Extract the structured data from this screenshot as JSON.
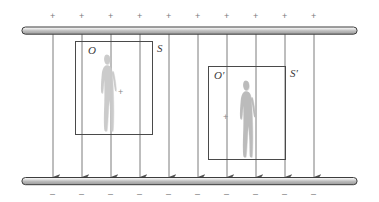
{
  "figure": {
    "background_color": "#ffffff",
    "width": 379,
    "height": 202
  },
  "plates": {
    "top": {
      "name": "positive-plate",
      "charge_symbol": "+",
      "charge_count": 10,
      "color_light": "#f2f2f2",
      "color_dark": "#9a9a9a",
      "outline_color": "#3d3d3d",
      "x1": 22,
      "x2": 357,
      "y": 27,
      "thickness": 7
    },
    "bottom": {
      "name": "negative-plate",
      "charge_symbol": "–",
      "charge_count": 10,
      "color_light": "#f2f2f2",
      "color_dark": "#9a9a9a",
      "outline_color": "#3d3d3d",
      "x1": 22,
      "x2": 357,
      "y": 180,
      "thickness": 7
    }
  },
  "field_lines": {
    "name": "electric-field-lines",
    "count": 10,
    "direction": "downward",
    "color": "#5c5c5c",
    "x_positions": [
      53,
      82,
      111,
      140,
      169,
      198,
      227,
      256,
      285,
      314
    ],
    "y_start": 31,
    "y_end": 177
  },
  "charge_signs": {
    "top_symbol": "+",
    "bottom_symbol": "–",
    "x_positions": [
      53,
      82,
      111,
      140,
      169,
      198,
      227,
      256,
      285,
      314
    ],
    "top_y": 12,
    "bottom_y": 190
  },
  "frames": [
    {
      "name": "frame-S",
      "observer_label": "O",
      "frame_label": "S",
      "origin_symbol": "+",
      "x": 75,
      "y": 41,
      "width": 77,
      "height": 93,
      "border_color": "#4a4a4a",
      "observer_label_x": 88,
      "observer_label_y": 46,
      "frame_label_x": 157,
      "frame_label_y": 44,
      "origin_x": 120,
      "origin_y": 92,
      "person": {
        "name": "observer-silhouette-O",
        "x": 99,
        "y": 54,
        "width": 18,
        "height": 78,
        "color": "#c9c9c9",
        "facing": "right"
      }
    },
    {
      "name": "frame-S-prime",
      "observer_label": "O′",
      "frame_label": "S′",
      "origin_symbol": "+",
      "x": 208,
      "y": 66,
      "width": 77,
      "height": 93,
      "border_color": "#4a4a4a",
      "observer_label_x": 214,
      "observer_label_y": 72,
      "frame_label_x": 290,
      "frame_label_y": 69,
      "origin_x": 225,
      "origin_y": 117,
      "person": {
        "name": "observer-silhouette-O-prime",
        "x": 238,
        "y": 80,
        "width": 18,
        "height": 78,
        "color": "#b8b8b8",
        "facing": "right"
      }
    }
  ]
}
